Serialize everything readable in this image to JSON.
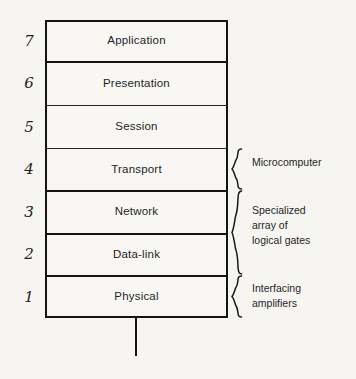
{
  "figure": {
    "type": "osi-layer-stack-diagram",
    "layers": [
      {
        "number": "7",
        "name": "Application",
        "top": 20,
        "height": 41
      },
      {
        "number": "6",
        "name": "Presentation",
        "top": 61,
        "height": 44
      },
      {
        "number": "5",
        "name": "Session",
        "top": 105,
        "height": 43
      },
      {
        "number": "4",
        "name": "Transport",
        "top": 148,
        "height": 42
      },
      {
        "number": "3",
        "name": "Network",
        "top": 190,
        "height": 43
      },
      {
        "number": "2",
        "name": "Data-link",
        "top": 233,
        "height": 42
      },
      {
        "number": "1",
        "name": "Physical",
        "top": 275,
        "height": 43
      }
    ],
    "annotations": [
      {
        "label": "Microcomputer",
        "brace_top": 148,
        "brace_height": 42,
        "text_top": 155
      },
      {
        "label": "Specialized\narray of\nlogical gates",
        "brace_top": 190,
        "brace_height": 85,
        "text_top": 203
      },
      {
        "label": "Interfacing\namplifiers",
        "brace_top": 275,
        "brace_height": 43,
        "text_top": 281
      }
    ],
    "stem": {
      "present": true
    },
    "colors": {
      "ink": "#141414",
      "text": "#1f1f1f",
      "paper": "#f6f5f2",
      "box_fill": "#f8f7f4"
    }
  }
}
